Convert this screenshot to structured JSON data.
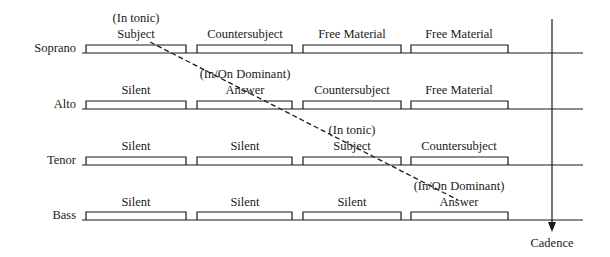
{
  "diagram": {
    "voices": [
      {
        "name": "Soprano",
        "segments": [
          "Subject",
          "Countersubject",
          "Free Material",
          "Free Material"
        ]
      },
      {
        "name": "Alto",
        "segments": [
          "Silent",
          "Answer",
          "Countersubject",
          "Free Material"
        ]
      },
      {
        "name": "Tenor",
        "segments": [
          "Silent",
          "Silent",
          "Subject",
          "Countersubject"
        ]
      },
      {
        "name": "Bass",
        "segments": [
          "Silent",
          "Silent",
          "Silent",
          "Answer"
        ]
      }
    ],
    "annotations": {
      "soprano_key": "(In tonic)",
      "alto_key": "(In/On Dominant)",
      "tenor_key": "(In tonic)",
      "bass_key": "(In/On Dominant)"
    },
    "cadence_label": "Cadence",
    "line_color": "#1a1a1a"
  }
}
